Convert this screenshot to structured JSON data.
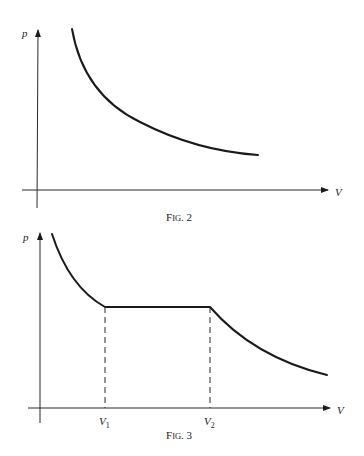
{
  "figures": [
    {
      "id": "fig2",
      "caption": {
        "prefix": "F",
        "smallcaps": "IG",
        "number": ". 2"
      },
      "axes": {
        "y_label": "p",
        "x_label": "V"
      }
    },
    {
      "id": "fig3",
      "caption": {
        "prefix": "F",
        "smallcaps": "IG",
        "number": ". 3"
      },
      "axes": {
        "y_label": "p",
        "x_label": "V"
      },
      "ticks": [
        {
          "label": "V",
          "sub": "1"
        },
        {
          "label": "V",
          "sub": "2"
        }
      ]
    }
  ],
  "colors": {
    "ink": "#1a1a1a",
    "background": "#ffffff"
  }
}
